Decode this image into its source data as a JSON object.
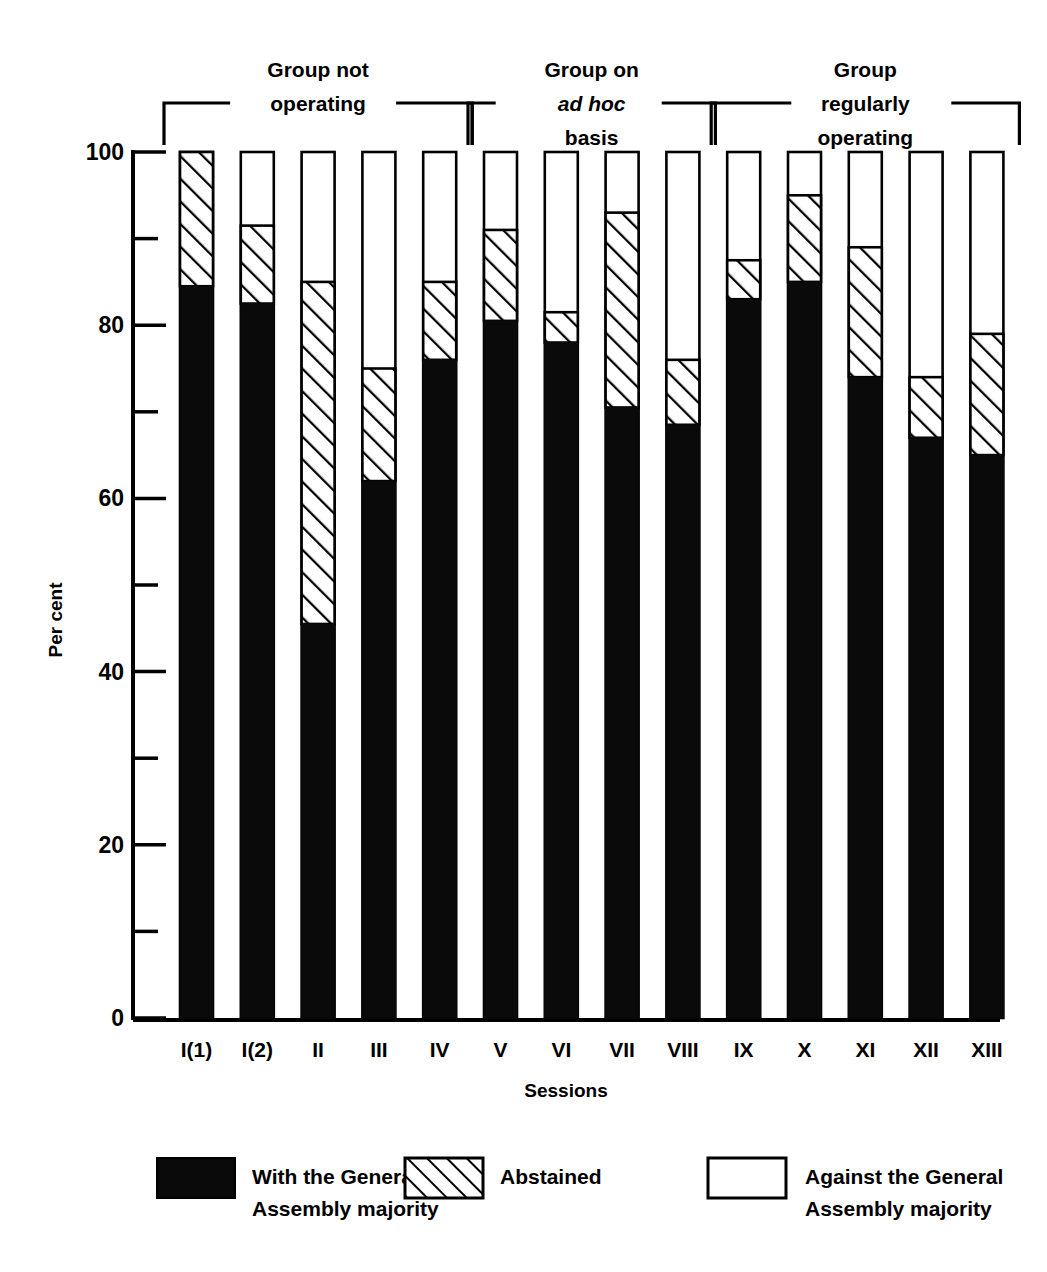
{
  "chart_data": {
    "type": "bar",
    "subtype": "stacked-bar",
    "title": "",
    "xlabel": "Sessions",
    "ylabel": "Per cent",
    "ylim": [
      0,
      100
    ],
    "yticks_major": [
      0,
      20,
      40,
      60,
      80,
      100
    ],
    "yticks_minor": [
      10,
      30,
      50,
      70,
      90
    ],
    "grid": false,
    "legend_position": "bottom",
    "categories": [
      "I(1)",
      "I(2)",
      "II",
      "III",
      "IV",
      "V",
      "VI",
      "VII",
      "VIII",
      "IX",
      "X",
      "XI",
      "XII",
      "XIII"
    ],
    "series": [
      {
        "name": "With the General Assembly majority",
        "pattern": "solid-black",
        "values": [
          84.5,
          82.5,
          45.5,
          62.0,
          76.0,
          80.5,
          78.0,
          70.5,
          68.5,
          83.0,
          85.0,
          74.0,
          67.0,
          65.0
        ]
      },
      {
        "name": "Abstained",
        "pattern": "diagonal-hatch",
        "values": [
          15.5,
          9.0,
          39.5,
          13.0,
          9.0,
          10.5,
          3.5,
          22.5,
          7.5,
          4.5,
          10.0,
          15.0,
          7.0,
          14.0
        ]
      },
      {
        "name": "Against the General Assembly majority",
        "pattern": "white-open",
        "values": [
          0.0,
          8.5,
          15.0,
          25.0,
          15.0,
          9.0,
          18.5,
          7.0,
          24.0,
          12.5,
          5.0,
          11.0,
          26.0,
          21.0
        ]
      }
    ],
    "cumulative_tops": {
      "black_top": [
        84.5,
        82.5,
        45.5,
        62.0,
        76.0,
        80.5,
        78.0,
        70.5,
        68.5,
        83.0,
        85.0,
        74.0,
        67.0,
        65.0
      ],
      "hatch_top": [
        100.0,
        91.5,
        85.0,
        75.0,
        85.0,
        91.0,
        81.5,
        93.0,
        76.0,
        87.5,
        95.0,
        89.0,
        74.0,
        79.0
      ],
      "bar_top": [
        100,
        100,
        100,
        100,
        100,
        100,
        100,
        100,
        100,
        100,
        100,
        100,
        100,
        100
      ]
    }
  },
  "axis": {
    "y_label": "Per cent",
    "x_label": "Sessions",
    "y_tick_labels": [
      "100",
      "80",
      "60",
      "40",
      "20",
      "0"
    ]
  },
  "groups": [
    {
      "id": "group-not-operating",
      "lines": [
        "Group not",
        "operating"
      ],
      "first_index": 0,
      "last_index": 4
    },
    {
      "id": "group-ad-hoc",
      "lines": [
        "Group on",
        "ad hoc",
        "basis"
      ],
      "italic_line": 1,
      "first_index": 5,
      "last_index": 8
    },
    {
      "id": "group-regularly-operating",
      "lines": [
        "Group",
        "regularly",
        "operating"
      ],
      "first_index": 9,
      "last_index": 13
    }
  ],
  "legend": {
    "items": [
      {
        "id": "legend-with-majority",
        "swatch": "solid-black",
        "lines": [
          "With the General",
          "Assembly majority"
        ]
      },
      {
        "id": "legend-abstained",
        "swatch": "diagonal-hatch",
        "lines": [
          "Abstained"
        ]
      },
      {
        "id": "legend-against-majority",
        "swatch": "white-open",
        "lines": [
          "Against the General",
          "Assembly majority"
        ]
      }
    ]
  },
  "colors": {
    "ink": "#000000",
    "paper": "#ffffff",
    "with_majority": "#0a0a0a",
    "abstained_fill": "#ffffff",
    "against_fill": "#ffffff"
  }
}
